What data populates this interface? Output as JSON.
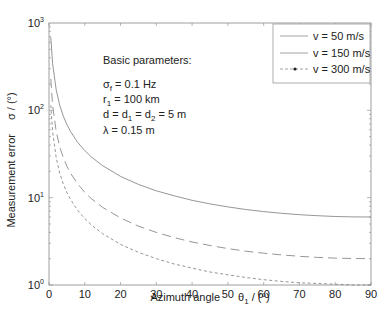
{
  "chart_data": {
    "type": "line",
    "title": "",
    "xlabel": "Azimuth angle",
    "xlabel_symbol": "θ",
    "xlabel_sub": "1",
    "xlabel_unit": " / (°)",
    "ylabel": "Measurement error",
    "ylabel_symbol": "σ / (°)",
    "xlim": [
      0,
      90
    ],
    "ylim": [
      1,
      1000
    ],
    "yscale": "log",
    "xticks": [
      0,
      10,
      20,
      30,
      40,
      50,
      60,
      70,
      80,
      90
    ],
    "yticks": [
      {
        "base": "10",
        "exp": "0",
        "value": 1
      },
      {
        "base": "10",
        "exp": "1",
        "value": 10
      },
      {
        "base": "10",
        "exp": "2",
        "value": 100
      },
      {
        "base": "10",
        "exp": "3",
        "value": 1000
      }
    ],
    "grid": false,
    "legend_position": "upper right",
    "x": [
      0.5,
      1,
      2,
      3,
      4,
      5,
      6,
      8,
      10,
      12,
      15,
      20,
      25,
      30,
      35,
      40,
      45,
      50,
      55,
      60,
      65,
      70,
      75,
      80,
      85,
      90
    ],
    "series": [
      {
        "name": "v = 50 m/s",
        "style": "solid",
        "values": [
          687.5,
          343.8,
          171.9,
          114.6,
          86.0,
          68.8,
          57.4,
          43.1,
          34.6,
          28.9,
          23.2,
          17.5,
          14.2,
          12.0,
          10.5,
          9.33,
          8.49,
          7.83,
          7.32,
          6.93,
          6.62,
          6.39,
          6.21,
          6.09,
          6.02,
          6.0
        ]
      },
      {
        "name": "v = 150 m/s",
        "style": "longdash",
        "values": [
          229.2,
          114.6,
          57.3,
          38.2,
          28.7,
          22.9,
          19.1,
          14.4,
          11.5,
          9.62,
          7.73,
          5.85,
          4.73,
          4.0,
          3.49,
          3.11,
          2.83,
          2.61,
          2.44,
          2.31,
          2.21,
          2.13,
          2.07,
          2.03,
          2.01,
          2.0
        ]
      },
      {
        "name": "v = 300 m/s",
        "style": "shortdash",
        "values": [
          114.6,
          57.3,
          28.7,
          19.1,
          14.3,
          11.5,
          9.57,
          7.19,
          5.76,
          4.81,
          3.86,
          2.92,
          2.37,
          2.0,
          1.74,
          1.56,
          1.41,
          1.31,
          1.22,
          1.15,
          1.1,
          1.06,
          1.04,
          1.02,
          1.0,
          1.0
        ]
      }
    ],
    "annotations": {
      "title": "Basic parameters:",
      "lines": [
        {
          "sym": "σ",
          "sub": "f",
          "rest": " = 0.1 Hz"
        },
        {
          "sym": "r",
          "sub": "1",
          "rest": " = 100 km"
        },
        {
          "sym": "d = d",
          "sub": "1",
          "rest": " = d",
          "sub2": "2",
          "rest2": " = 5 m"
        },
        {
          "sym": "λ",
          "sub": "",
          "rest": " = 0.15 m"
        }
      ]
    },
    "colors": {
      "axis": "#777777",
      "line": "#8a8a8a",
      "text": "#222222"
    }
  }
}
